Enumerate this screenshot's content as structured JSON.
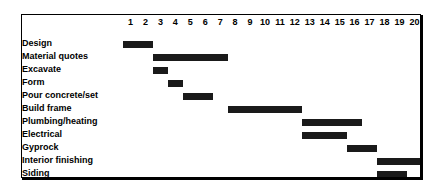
{
  "chart_data": {
    "type": "bar",
    "subtype": "gantt",
    "title": "",
    "xlabel": "",
    "ylabel": "",
    "x_axis_position": "top",
    "grid": true,
    "legend": false,
    "time_unit_count": 20,
    "time_ticks": [
      "1",
      "2",
      "3",
      "4",
      "5",
      "6",
      "7",
      "8",
      "9",
      "10",
      "11",
      "12",
      "13",
      "14",
      "15",
      "16",
      "17",
      "18",
      "19",
      "20"
    ],
    "xlim": [
      1,
      20
    ],
    "categories": [
      "Design",
      "Material quotes",
      "Excavate",
      "Form",
      "Pour concrete/set",
      "Build frame",
      "Plumbing/heating",
      "Electrical",
      "Gyprock",
      "Interior finishing",
      "Siding"
    ],
    "bar_color": "#1a1a1a",
    "grid_color": "#000000",
    "background_color": "#ffffff",
    "tasks": [
      {
        "name": "Design",
        "start": 1,
        "end": 2,
        "duration": 2
      },
      {
        "name": "Material quotes",
        "start": 3,
        "end": 7,
        "duration": 5
      },
      {
        "name": "Excavate",
        "start": 3,
        "end": 3,
        "duration": 1
      },
      {
        "name": "Form",
        "start": 4,
        "end": 4,
        "duration": 1
      },
      {
        "name": "Pour concrete/set",
        "start": 5,
        "end": 6,
        "duration": 2
      },
      {
        "name": "Build frame",
        "start": 8,
        "end": 12,
        "duration": 5
      },
      {
        "name": "Plumbing/heating",
        "start": 13,
        "end": 16,
        "duration": 4
      },
      {
        "name": "Electrical",
        "start": 13,
        "end": 15,
        "duration": 3
      },
      {
        "name": "Gyprock",
        "start": 16,
        "end": 17,
        "duration": 2
      },
      {
        "name": "Interior finishing",
        "start": 18,
        "end": 20,
        "duration": 3
      },
      {
        "name": "Siding",
        "start": 18,
        "end": 19,
        "duration": 2
      }
    ]
  }
}
